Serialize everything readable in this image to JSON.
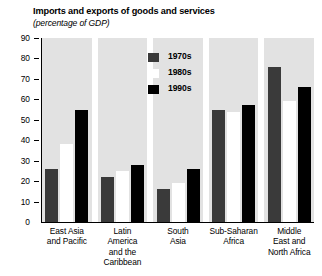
{
  "chart_data": {
    "type": "bar",
    "title": "Imports and exports of goods and services",
    "subtitle": "(percentage of GDP)",
    "xlabel": "",
    "ylabel": "",
    "ylim": [
      0,
      90
    ],
    "yticks": [
      0,
      10,
      20,
      30,
      40,
      50,
      60,
      70,
      80,
      90
    ],
    "grid": false,
    "legend_position": "upper center",
    "categories": [
      "East Asia and Pacific",
      "Latin America and the Caribbean",
      "South Asia",
      "Sub-Saharan Africa",
      "Middle East and North Africa"
    ],
    "category_lines": [
      [
        "East Asia",
        "and Pacific"
      ],
      [
        "Latin",
        "America",
        "and the",
        "Caribbean"
      ],
      [
        "South",
        "Asia"
      ],
      [
        "Sub-Saharan",
        "Africa"
      ],
      [
        "Middle",
        "East and",
        "North Africa"
      ]
    ],
    "series": [
      {
        "name": "1970s",
        "color": "#3a3a3a",
        "values": [
          26,
          22,
          16,
          55,
          76
        ]
      },
      {
        "name": "1980s",
        "color": "#ffffff",
        "values": [
          38,
          25,
          19,
          54,
          59
        ]
      },
      {
        "name": "1990s",
        "color": "#000000",
        "values": [
          55,
          28,
          26,
          57,
          66
        ]
      }
    ]
  }
}
